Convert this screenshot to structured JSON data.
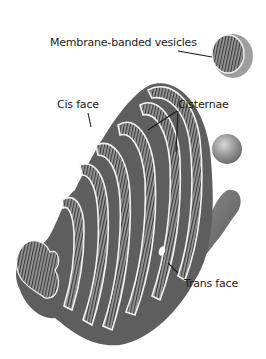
{
  "figure": {
    "background": "#ffffff",
    "colors": {
      "membrane_fill": "#6e6e6e",
      "membrane_dark": "#555555",
      "lumen_stripe": "#3a3a3a",
      "edge_highlight": "#f5f5f5",
      "vesicle_sphere": "#8a8a8a",
      "label_text": "#1a1a1a"
    }
  },
  "labels": {
    "vesicles": "Membrane-banded vesicles",
    "cis_face": "Cis face",
    "cisternae": "Cisternae",
    "trans_face": "Trans face"
  }
}
